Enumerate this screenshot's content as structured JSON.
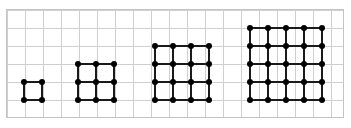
{
  "canvas": {
    "width": 351,
    "height": 128,
    "background": "#ffffff"
  },
  "grid": {
    "label": "graph-paper-grid",
    "left": 6,
    "top": 9,
    "width": 338,
    "height": 109,
    "cell_size": 18,
    "columns": 19,
    "rows": 6,
    "line_color": "#cfcfcf",
    "border_color": "#c4c4c4",
    "border_width": 1
  },
  "style": {
    "node_color": "#000000",
    "node_diameter": 6,
    "edge_color": "#1a1a1a",
    "edge_thickness": 2,
    "cell_pitch": 18
  },
  "chart_data": {
    "type": "scatter",
    "xlabel": "",
    "ylabel": "",
    "grid": true,
    "legend": "none",
    "categories": [
      "Figure 1",
      "Figure 2",
      "Figure 3",
      "Figure 4"
    ],
    "series": [
      {
        "name": "Cells per side",
        "values": [
          1,
          2,
          3,
          4
        ]
      },
      {
        "name": "Dots per side",
        "values": [
          2,
          3,
          4,
          5
        ]
      },
      {
        "name": "Total dots",
        "values": [
          4,
          9,
          16,
          25
        ]
      },
      {
        "name": "Total segments",
        "values": [
          4,
          12,
          24,
          40
        ]
      }
    ]
  },
  "figures": [
    {
      "name": "figure-1",
      "label": "Figure 1",
      "cells_per_side": 1,
      "dots_per_side": 2,
      "total_dots": 4,
      "total_segments": 4,
      "left": 24,
      "top": 82,
      "size": 18
    },
    {
      "name": "figure-2",
      "label": "Figure 2",
      "cells_per_side": 2,
      "dots_per_side": 3,
      "total_dots": 9,
      "total_segments": 12,
      "left": 78,
      "top": 64,
      "size": 36
    },
    {
      "name": "figure-3",
      "label": "Figure 3",
      "cells_per_side": 3,
      "dots_per_side": 4,
      "total_dots": 16,
      "total_segments": 24,
      "left": 155,
      "top": 46,
      "size": 54
    },
    {
      "name": "figure-4",
      "label": "Figure 4",
      "cells_per_side": 4,
      "dots_per_side": 5,
      "total_dots": 25,
      "total_segments": 40,
      "left": 250,
      "top": 28,
      "size": 72
    }
  ]
}
